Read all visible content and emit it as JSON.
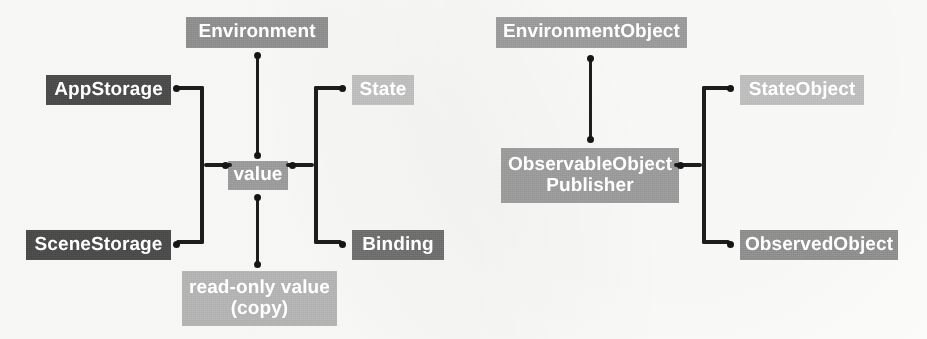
{
  "diagram": {
    "background_color": "#fcfcfa",
    "line_color": "#1d1d1d",
    "groups": [
      {
        "id": "value-type-group",
        "name": "Value type property wrappers",
        "center_node": {
          "id": "value",
          "label": "value",
          "color": "#9a9a9a"
        },
        "top_node": {
          "id": "environment",
          "label": "Environment",
          "color": "#8e8e8e"
        },
        "bottom_node": {
          "id": "read-only-value",
          "label": "read-only value\n(copy)",
          "color": "#b3b3b3"
        },
        "left_nodes": [
          {
            "id": "appstorage",
            "label": "AppStorage",
            "color": "#4b4b4b"
          },
          {
            "id": "scenestorage",
            "label": "SceneStorage",
            "color": "#4b4b4b"
          }
        ],
        "right_nodes": [
          {
            "id": "state",
            "label": "State",
            "color": "#bdbdbd"
          },
          {
            "id": "binding",
            "label": "Binding",
            "color": "#6e6e6e"
          }
        ]
      },
      {
        "id": "reference-type-group",
        "name": "Reference type property wrappers",
        "center_node": {
          "id": "observableobject-publisher",
          "label": "ObservableObject\nPublisher",
          "color": "#9a9a9a"
        },
        "top_node": {
          "id": "environmentobject",
          "label": "EnvironmentObject",
          "color": "#9a9a9a"
        },
        "right_nodes": [
          {
            "id": "stateobject",
            "label": "StateObject",
            "color": "#bdbdbd"
          },
          {
            "id": "observedobject",
            "label": "ObservedObject",
            "color": "#8e8e8e"
          }
        ]
      }
    ],
    "connectors": [
      {
        "id": "environment-to-value",
        "from": "environment",
        "to": "value",
        "style": "line-with-dots"
      },
      {
        "id": "value-to-read-only-value",
        "from": "value",
        "to": "read-only-value",
        "style": "line-with-dots"
      },
      {
        "id": "value-to-storage-bracket",
        "from": "value",
        "to": [
          "appstorage",
          "scenestorage"
        ],
        "style": "bracket"
      },
      {
        "id": "value-to-state-binding-bracket",
        "from": "value",
        "to": [
          "state",
          "binding"
        ],
        "style": "bracket"
      },
      {
        "id": "environmentobject-to-publisher",
        "from": "environmentobject",
        "to": "observableobject-publisher",
        "style": "line-with-dots"
      },
      {
        "id": "publisher-to-objects-bracket",
        "from": "observableobject-publisher",
        "to": [
          "stateobject",
          "observedobject"
        ],
        "style": "bracket"
      }
    ]
  }
}
